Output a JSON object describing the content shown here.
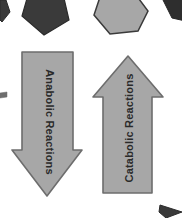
{
  "canvas": {
    "width": 182,
    "height": 218,
    "background": "#ffffff"
  },
  "palette": {
    "arrow_fill": "#a7a7a7",
    "arrow_stroke": "#6d6d6d",
    "shape_dark_fill": "#3a3a3a",
    "shape_dark_stroke": "#2b2b2b",
    "shape_light_fill": "#a7a7a7",
    "shape_light_stroke": "#3a3a3a",
    "label_color": "#2a2a2a",
    "background": "#ffffff"
  },
  "diagram": {
    "arrows": [
      {
        "id": "anabolic",
        "label": "Anabolic Reactions",
        "direction": "down",
        "label_rotation_deg": 90,
        "fill": "#a7a7a7",
        "stroke": "#6d6d6d",
        "points": "22,52 73,52 73,150 82,150 47,196 12,150 22,150",
        "label_x": 49,
        "label_y": 122,
        "font_size": 11
      },
      {
        "id": "catabolic",
        "label": "Catabolic Reactions",
        "direction": "up",
        "label_rotation_deg": -90,
        "fill": "#a7a7a7",
        "stroke": "#6d6d6d",
        "points": "128,56 163,97 152,97 152,193 103,193 103,97 93,97",
        "label_x": 130,
        "label_y": 128,
        "font_size": 11
      }
    ],
    "decor_shapes": [
      {
        "id": "corner-sliver-top-left",
        "shape": "polygon",
        "points": "0,0 6,0 10,12 2,22 0,20",
        "fill": "#3a3a3a",
        "stroke": "#2b2b2b"
      },
      {
        "id": "pentagon-dark-top-left",
        "shape": "polygon",
        "points": "30,-12 63,-6 69,20 44,35 22,16",
        "fill": "#3a3a3a",
        "stroke": "#2b2b2b"
      },
      {
        "id": "hexagon-light-top-center",
        "shape": "polygon",
        "points": "101,-6 133,-9 148,11 138,31 110,34 94,15",
        "fill": "#a7a7a7",
        "stroke": "#3a3a3a"
      },
      {
        "id": "polygon-dark-top-right",
        "shape": "polygon",
        "points": "158,-10 190,-6 190,22 172,18",
        "fill": "#2e2e2e",
        "stroke": "#262626"
      },
      {
        "id": "tick-dark-left-edge",
        "shape": "polygon",
        "points": "0,93 7,92 7,97 0,98",
        "fill": "#6d6d6d",
        "stroke": "#6d6d6d"
      },
      {
        "id": "arrowhead-dark-bottom-right",
        "shape": "polygon",
        "points": "160,205 182,212 166,218 159,212",
        "fill": "#3a3a3a",
        "stroke": "#2b2b2b"
      }
    ]
  }
}
